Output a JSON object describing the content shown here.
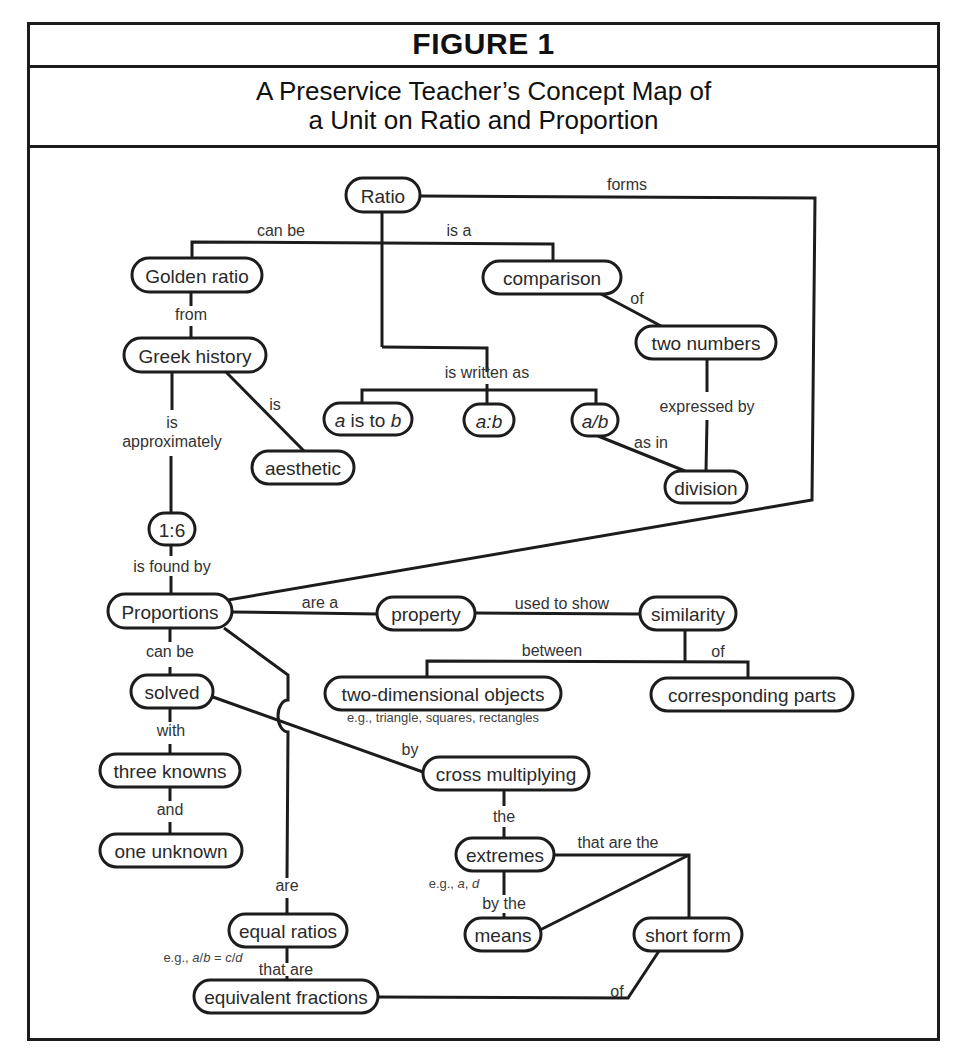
{
  "header": {
    "figure_label": "FIGURE 1",
    "title_line1": "A Preservice Teacher’s Concept Map of",
    "title_line2": "a Unit on Ratio and Proportion"
  },
  "nodes": [
    {
      "id": "ratio",
      "label": "Ratio",
      "x": 346,
      "y": 178,
      "w": 74,
      "h": 34
    },
    {
      "id": "golden-ratio",
      "label": "Golden ratio",
      "x": 132,
      "y": 258,
      "w": 130,
      "h": 34
    },
    {
      "id": "comparison",
      "label": "comparison",
      "x": 483,
      "y": 261,
      "w": 138,
      "h": 33
    },
    {
      "id": "greek-history",
      "label": "Greek history",
      "x": 124,
      "y": 338,
      "w": 142,
      "h": 34
    },
    {
      "id": "two-numbers",
      "label": "two numbers",
      "x": 636,
      "y": 326,
      "w": 140,
      "h": 33
    },
    {
      "id": "a-is-to-b",
      "label": "a is to b",
      "x": 324,
      "y": 403,
      "w": 88,
      "h": 32,
      "italic_parts": true
    },
    {
      "id": "a-colon-b",
      "label": "a:b",
      "x": 464,
      "y": 404,
      "w": 50,
      "h": 32,
      "italic": true
    },
    {
      "id": "a-slash-b",
      "label": "a/b",
      "x": 572,
      "y": 404,
      "w": 46,
      "h": 32,
      "italic": true
    },
    {
      "id": "aesthetic",
      "label": "aesthetic",
      "x": 252,
      "y": 451,
      "w": 102,
      "h": 33
    },
    {
      "id": "division",
      "label": "division",
      "x": 665,
      "y": 471,
      "w": 82,
      "h": 32
    },
    {
      "id": "one-point-six",
      "label": "1:6",
      "x": 149,
      "y": 513,
      "w": 46,
      "h": 32
    },
    {
      "id": "proportions",
      "label": "Proportions",
      "x": 108,
      "y": 594,
      "w": 124,
      "h": 34
    },
    {
      "id": "property",
      "label": "property",
      "x": 377,
      "y": 597,
      "w": 98,
      "h": 33
    },
    {
      "id": "similarity",
      "label": "similarity",
      "x": 640,
      "y": 597,
      "w": 96,
      "h": 33
    },
    {
      "id": "solved",
      "label": "solved",
      "x": 131,
      "y": 675,
      "w": 82,
      "h": 33
    },
    {
      "id": "two-dimensional-objects",
      "label": "two-dimensional objects",
      "x": 325,
      "y": 677,
      "w": 236,
      "h": 33
    },
    {
      "id": "corresponding-parts",
      "label": "corresponding parts",
      "x": 651,
      "y": 678,
      "w": 202,
      "h": 33
    },
    {
      "id": "three-knowns",
      "label": "three knowns",
      "x": 100,
      "y": 754,
      "w": 140,
      "h": 33
    },
    {
      "id": "cross-multiplying",
      "label": "cross multiplying",
      "x": 423,
      "y": 757,
      "w": 166,
      "h": 33
    },
    {
      "id": "one-unknown",
      "label": "one unknown",
      "x": 100,
      "y": 834,
      "w": 142,
      "h": 33
    },
    {
      "id": "extremes",
      "label": "extremes",
      "x": 456,
      "y": 838,
      "w": 98,
      "h": 33
    },
    {
      "id": "means",
      "label": "means",
      "x": 465,
      "y": 918,
      "w": 76,
      "h": 33
    },
    {
      "id": "short-form",
      "label": "short form",
      "x": 634,
      "y": 918,
      "w": 108,
      "h": 33
    },
    {
      "id": "equal-ratios",
      "label": "equal ratios",
      "x": 229,
      "y": 914,
      "w": 118,
      "h": 33
    },
    {
      "id": "equivalent-fractions",
      "label": "equivalent fractions",
      "x": 194,
      "y": 980,
      "w": 184,
      "h": 33
    }
  ],
  "linking_phrases": [
    {
      "text": "forms",
      "x": 627,
      "y": 190
    },
    {
      "text": "can be",
      "x": 281,
      "y": 236
    },
    {
      "text": "is a",
      "x": 459,
      "y": 236
    },
    {
      "text": "from",
      "x": 191,
      "y": 320
    },
    {
      "text": "of",
      "x": 637,
      "y": 304
    },
    {
      "text": "is written as",
      "x": 487,
      "y": 378
    },
    {
      "text": "is",
      "x": 275,
      "y": 410
    },
    {
      "text": "is",
      "x": 172,
      "y": 428
    },
    {
      "text": "approximately",
      "x": 172,
      "y": 447
    },
    {
      "text": "expressed by",
      "x": 707,
      "y": 412
    },
    {
      "text": "as in",
      "x": 651,
      "y": 448
    },
    {
      "text": "is found by",
      "x": 172,
      "y": 572
    },
    {
      "text": "are a",
      "x": 320,
      "y": 608
    },
    {
      "text": "used to show",
      "x": 562,
      "y": 609
    },
    {
      "text": "can be",
      "x": 170,
      "y": 657
    },
    {
      "text": "between",
      "x": 552,
      "y": 656
    },
    {
      "text": "of",
      "x": 718,
      "y": 657
    },
    {
      "text": "with",
      "x": 171,
      "y": 736
    },
    {
      "text": "by",
      "x": 410,
      "y": 755
    },
    {
      "text": "and",
      "x": 170,
      "y": 815
    },
    {
      "text": "the",
      "x": 504,
      "y": 822
    },
    {
      "text": "that are the",
      "x": 618,
      "y": 848
    },
    {
      "text": "are",
      "x": 287,
      "y": 891
    },
    {
      "text": "by the",
      "x": 504,
      "y": 909
    },
    {
      "text": "that are",
      "x": 286,
      "y": 975
    },
    {
      "text": "of",
      "x": 617,
      "y": 997
    }
  ],
  "annotations": [
    {
      "text": "e.g., triangle, squares, rectangles",
      "x": 443,
      "y": 722
    },
    {
      "text": "e.g., a, d",
      "x": 454,
      "y": 888
    },
    {
      "text": "e.g., a/b = c/d",
      "x": 203,
      "y": 962
    }
  ],
  "relationships": [
    {
      "from": "Ratio",
      "phrase": "forms",
      "to": "Proportions"
    },
    {
      "from": "Ratio",
      "phrase": "can be",
      "to": "Golden ratio"
    },
    {
      "from": "Ratio",
      "phrase": "is a",
      "to": "comparison"
    },
    {
      "from": "Ratio",
      "phrase": "is written as",
      "to": [
        "a is to b",
        "a:b",
        "a/b"
      ]
    },
    {
      "from": "comparison",
      "phrase": "of",
      "to": "two numbers"
    },
    {
      "from": "two numbers",
      "phrase": "expressed by",
      "to": "division"
    },
    {
      "from": "a/b",
      "phrase": "as in",
      "to": "division"
    },
    {
      "from": "Golden ratio",
      "phrase": "from",
      "to": "Greek history"
    },
    {
      "from": "Greek history",
      "phrase": "is",
      "to": "aesthetic"
    },
    {
      "from": "Greek history",
      "phrase": "is approximately",
      "to": "1:6"
    },
    {
      "from": "1:6",
      "phrase": "is found by",
      "to": "Proportions"
    },
    {
      "from": "Proportions",
      "phrase": "are a",
      "to": "property"
    },
    {
      "from": "property",
      "phrase": "used to show",
      "to": "similarity"
    },
    {
      "from": "similarity",
      "phrase": "between",
      "to": "two-dimensional objects"
    },
    {
      "from": "similarity",
      "phrase": "of",
      "to": "corresponding parts"
    },
    {
      "from": "Proportions",
      "phrase": "can be",
      "to": "solved"
    },
    {
      "from": "solved",
      "phrase": "with",
      "to": "three knowns"
    },
    {
      "from": "three knowns",
      "phrase": "and",
      "to": "one unknown"
    },
    {
      "from": "solved",
      "phrase": "by",
      "to": "cross multiplying"
    },
    {
      "from": "cross multiplying",
      "phrase": "the",
      "to": "extremes"
    },
    {
      "from": "extremes",
      "phrase": "by the",
      "to": "means"
    },
    {
      "from": "extremes",
      "phrase": "that are the",
      "to": "short form"
    },
    {
      "from": "means",
      "phrase": "that are the",
      "to": "short form"
    },
    {
      "from": "Proportions",
      "phrase": "are",
      "to": "equal ratios"
    },
    {
      "from": "equal ratios",
      "phrase": "that are",
      "to": "equivalent fractions"
    },
    {
      "from": "short form",
      "phrase": "of",
      "to": "equivalent fractions"
    }
  ]
}
